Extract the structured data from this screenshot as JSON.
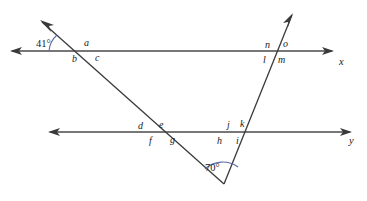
{
  "figure": {
    "background_color": "#ffffff",
    "line_color": "#4a4a4a",
    "arc_color": "#5a6aa8",
    "label_color": "#1a1a1a",
    "width": 367,
    "height": 201
  },
  "axis_labels": [
    {
      "id": "axis-x",
      "text": "x",
      "x": 339,
      "y": 65
    },
    {
      "id": "axis-y",
      "text": "y",
      "x": 349,
      "y": 144
    }
  ],
  "angle_measures": [
    {
      "id": "angle-41",
      "text": "41°",
      "x": 36,
      "y": 47
    },
    {
      "id": "angle-70",
      "text": "70°",
      "x": 205,
      "y": 171
    }
  ],
  "angle_labels": [
    {
      "id": "label-a",
      "text": "a",
      "x": 84,
      "y": 46
    },
    {
      "id": "label-b",
      "text": "b",
      "x": 72,
      "y": 62
    },
    {
      "id": "label-c",
      "text": "c",
      "x": 95,
      "y": 61
    },
    {
      "id": "label-n",
      "text": "n",
      "x": 265,
      "y": 48
    },
    {
      "id": "label-o",
      "text": "o",
      "x": 283,
      "y": 47
    },
    {
      "id": "label-l",
      "text": "l",
      "x": 263,
      "y": 63
    },
    {
      "id": "label-m",
      "text": "m",
      "x": 278,
      "y": 63
    },
    {
      "id": "label-d",
      "text": "d",
      "x": 138,
      "y": 129
    },
    {
      "id": "label-e",
      "text": "e",
      "x": 159,
      "y": 128
    },
    {
      "id": "label-f",
      "text": "f",
      "x": 149,
      "y": 144
    },
    {
      "id": "label-g",
      "text": "g",
      "x": 170,
      "y": 143
    },
    {
      "id": "label-j",
      "text": "j",
      "x": 227,
      "y": 128
    },
    {
      "id": "label-k",
      "text": "k",
      "x": 240,
      "y": 127
    },
    {
      "id": "label-h",
      "text": "h",
      "x": 217,
      "y": 144
    },
    {
      "id": "label-i",
      "text": "i",
      "x": 236,
      "y": 144
    }
  ],
  "lines": {
    "upper_horizontal": {
      "name": "line-x",
      "x1": 12,
      "y1": 51,
      "x2": 332,
      "y2": 51
    },
    "lower_horizontal": {
      "name": "line-y",
      "x1": 50,
      "y1": 132,
      "x2": 350,
      "y2": 132
    },
    "left_transversal": {
      "name": "transversal-left",
      "x1": 42,
      "y1": 22,
      "x2": 224,
      "y2": 184
    },
    "right_transversal": {
      "name": "transversal-right",
      "x1": 224,
      "y1": 184,
      "x2": 292,
      "y2": 15
    }
  },
  "intersections": [
    {
      "id": "vertex-upper-left",
      "x": 73,
      "y": 51
    },
    {
      "id": "vertex-upper-right",
      "x": 277,
      "y": 51
    },
    {
      "id": "vertex-lower-left",
      "x": 152,
      "y": 132
    },
    {
      "id": "vertex-lower-right",
      "x": 232,
      "y": 132
    },
    {
      "id": "vertex-triangle-apex",
      "x": 224,
      "y": 184
    }
  ]
}
